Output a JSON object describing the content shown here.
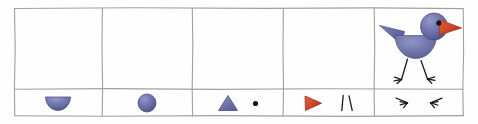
{
  "figure": {
    "background_color": "#fefefe",
    "border_color": "#9a9a9a"
  },
  "palette": {
    "blue": "#6a70a8",
    "blue_dark": "#4d5286",
    "blue_light": "#8f95c4",
    "red": "#cf4428",
    "red_dark": "#a8331d",
    "black": "#1a1a1a",
    "grid_line": "#a0a0a0"
  },
  "grid": {
    "columns": 5,
    "rows": 2,
    "row_labels": [
      "assembled",
      "parts"
    ]
  },
  "cells": [
    {
      "column": 1,
      "row": "parts",
      "name": "body-half-circle",
      "shape": "half-circle",
      "color": "#6a70a8",
      "label": ""
    },
    {
      "column": 2,
      "row": "parts",
      "name": "head-circle",
      "shape": "circle",
      "color": "#6a70a8",
      "label": ""
    },
    {
      "column": 3,
      "row": "parts",
      "name": "wing-triangle-and-eye-dot",
      "shape": "triangle + dot",
      "color": "#6a70a8",
      "dot_color": "#1a1a1a",
      "label": ""
    },
    {
      "column": 4,
      "row": "parts",
      "name": "beak-triangle-and-legs",
      "shape": "right-pointing triangle + two lines",
      "color": "#cf4428",
      "line_color": "#1a1a1a",
      "label": ""
    },
    {
      "column": 5,
      "row": "parts",
      "name": "feet-pair",
      "shape": "two three-toed feet",
      "color": "#1a1a1a",
      "label": ""
    },
    {
      "column": 5,
      "row": "assembled",
      "name": "assembled-bird",
      "shape": "bird",
      "color": "#6a70a8",
      "beak_color": "#cf4428",
      "leg_color": "#1a1a1a",
      "label": ""
    }
  ],
  "empty_cells": [
    {
      "column": 1,
      "row": "assembled"
    },
    {
      "column": 2,
      "row": "assembled"
    },
    {
      "column": 3,
      "row": "assembled"
    },
    {
      "column": 4,
      "row": "assembled"
    }
  ]
}
